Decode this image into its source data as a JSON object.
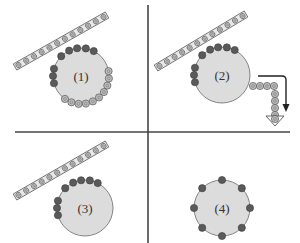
{
  "colors": {
    "background": "#ffffff",
    "divider": "#444444",
    "disk_fill": "#dcdcdc",
    "disk_stroke": "#777777",
    "dark_bead": "#5a5a5a",
    "light_bead": "#bdbdbd",
    "rod_fill": "#e8e8e8",
    "rod_stroke": "#666666",
    "arrow": "#222222"
  },
  "panels": [
    {
      "id": "panel-1",
      "label": "(1)",
      "cx": 81,
      "cy": 76,
      "r": 28,
      "rod": {
        "x1": 15,
        "y1": 67,
        "x2": 107,
        "y2": 15
      },
      "dark_beads_deg": [
        165,
        180,
        195,
        225,
        245,
        262,
        280,
        297
      ],
      "light_beads_deg": [
        20,
        35,
        50,
        65,
        80,
        95,
        110,
        125,
        5,
        -10
      ]
    },
    {
      "id": "panel-2",
      "label": "(2)",
      "cx": 222,
      "cy": 75,
      "r": 28,
      "rod": {
        "x1": 156,
        "y1": 68,
        "x2": 246,
        "y2": 14
      },
      "dark_beads_deg": [
        165,
        180,
        195,
        225,
        245,
        262,
        280,
        297
      ],
      "light_beads_deg": [],
      "chain": [
        [
          253,
          86
        ],
        [
          260,
          86
        ],
        [
          267,
          86
        ],
        [
          274,
          86
        ],
        [
          275,
          94
        ],
        [
          275,
          101
        ],
        [
          275,
          108
        ],
        [
          275,
          115
        ]
      ],
      "arrow": {
        "path": "M258,76 L282,76 Q286,76 286,80 L286,105",
        "head": [
          286,
          112
        ]
      },
      "triangle": {
        "x": 275,
        "y": 116,
        "w": 18,
        "h": 10
      }
    },
    {
      "id": "panel-3",
      "label": "(3)",
      "cx": 85,
      "cy": 208,
      "r": 28,
      "rod": {
        "x1": 15,
        "y1": 197,
        "x2": 107,
        "y2": 144
      },
      "dark_beads_deg": [
        165,
        180,
        195,
        225,
        245,
        262,
        280,
        297
      ],
      "light_beads_deg": []
    },
    {
      "id": "panel-4",
      "label": "(4)",
      "cx": 222,
      "cy": 208,
      "r": 28,
      "rod": null,
      "dark_beads_deg": [
        0,
        45,
        90,
        135,
        180,
        225,
        270,
        315
      ],
      "light_beads_deg": []
    }
  ],
  "dividers": {
    "vertical": {
      "x": 148,
      "y1": 5,
      "y2": 243
    },
    "horizontal": {
      "y": 132,
      "x1": 15,
      "x2": 290
    }
  }
}
